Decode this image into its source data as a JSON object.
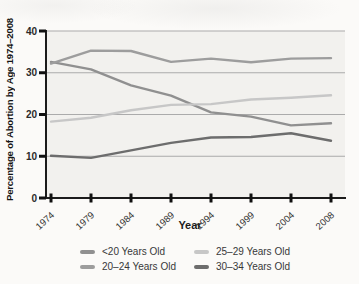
{
  "figure": {
    "background": "#fbfaf8",
    "plot_background": "#f2f1ee",
    "axis_color": "#1b1b1b",
    "tick_color": "#111111",
    "grid_color": "#ababab",
    "label_color": "#333333"
  },
  "chart_data": {
    "type": "line",
    "title": "",
    "xlabel": "Year",
    "ylabel": "Percentage of Abortion by Age 1974–2008",
    "categories": [
      "1974",
      "1979",
      "1984",
      "1989",
      "1994",
      "1999",
      "2004",
      "2008"
    ],
    "y_ticks": [
      0,
      10,
      20,
      30,
      40
    ],
    "ylim": [
      0,
      40
    ],
    "grid": true,
    "legend_position": "bottom",
    "legend_order": [
      0,
      2,
      1,
      3
    ],
    "series": [
      {
        "name": "<20 Years Old",
        "slug": "under-20-years-old",
        "color": "#909090",
        "values": [
          32.6,
          30.8,
          27.0,
          24.5,
          20.5,
          19.5,
          17.4,
          17.9
        ]
      },
      {
        "name": "20–24 Years Old",
        "slug": "20-24-years-old",
        "color": "#9d9d9d",
        "values": [
          32.2,
          35.3,
          35.2,
          32.6,
          33.4,
          32.5,
          33.4,
          33.5
        ]
      },
      {
        "name": "25–29 Years Old",
        "slug": "25-29-years-old",
        "color": "#c7c7c7",
        "values": [
          18.3,
          19.2,
          21.0,
          22.3,
          22.5,
          23.6,
          24.0,
          24.6
        ]
      },
      {
        "name": "30–34 Years Old",
        "slug": "30-34-years-old",
        "color": "#6d6d6d",
        "values": [
          10.1,
          9.6,
          11.4,
          13.2,
          14.5,
          14.6,
          15.5,
          13.7
        ]
      }
    ]
  }
}
